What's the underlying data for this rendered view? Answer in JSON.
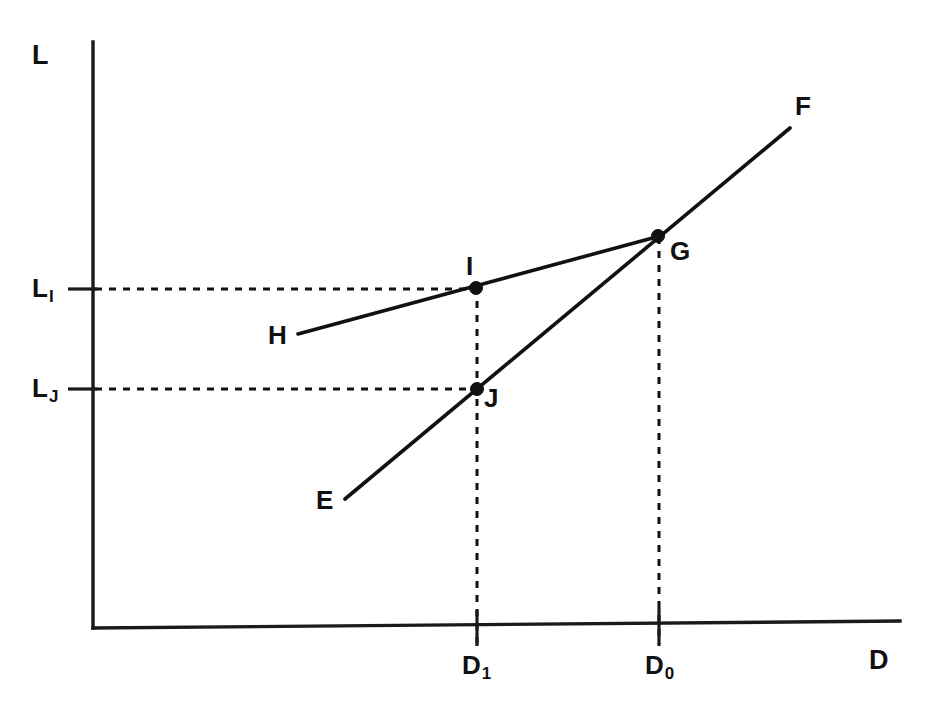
{
  "figure": {
    "type": "line-diagram",
    "background_color": "#ffffff",
    "ink_color": "#111111"
  },
  "axes": {
    "y_axis_label": "L",
    "x_axis_label": "D",
    "origin_px": [
      93,
      628
    ],
    "y_axis_top_px": [
      93,
      42
    ],
    "x_axis_right_px": [
      900,
      621
    ]
  },
  "y_ticks": [
    {
      "name": "L-sub-I",
      "base": "L",
      "sub": "I",
      "label_text": "L",
      "sub_text": "I",
      "y_px": 289
    },
    {
      "name": "L-sub-J",
      "base": "L",
      "sub": "J",
      "label_text": "L",
      "sub_text": "J",
      "y_px": 389
    }
  ],
  "x_ticks": [
    {
      "name": "D-sub-1",
      "base": "D",
      "sub": "1",
      "label_text": "D",
      "sub_text": "1",
      "x_px": 477
    },
    {
      "name": "D-sub-0",
      "base": "D",
      "sub": "0",
      "label_text": "D",
      "sub_text": "0",
      "x_px": 659
    }
  ],
  "lines": [
    {
      "name": "line-EF",
      "start_label": "E",
      "end_label": "F",
      "description": "steeper upward sloping line through J and G",
      "from_px": [
        345,
        499
      ],
      "to_px": [
        790,
        128
      ]
    },
    {
      "name": "line-HG",
      "start_label": "H",
      "end_label": "G",
      "description": "flatter upward sloping line through I ending at G",
      "from_px": [
        298,
        334
      ],
      "to_px": [
        660,
        236
      ]
    }
  ],
  "points": [
    {
      "name": "point-I",
      "label": "I",
      "x_px": 476,
      "y_px": 288,
      "label_pos_px": [
        466,
        253
      ]
    },
    {
      "name": "point-J",
      "label": "J",
      "x_px": 477,
      "y_px": 389,
      "label_pos_px": [
        484,
        385
      ]
    },
    {
      "name": "point-G",
      "label": "G",
      "x_px": 658,
      "y_px": 236,
      "label_pos_px": [
        670,
        238
      ]
    }
  ],
  "endpoint_labels": [
    {
      "name": "label-F",
      "text": "F",
      "pos_px": [
        795,
        93
      ]
    },
    {
      "name": "label-H",
      "text": "H",
      "pos_px": [
        268,
        322
      ]
    },
    {
      "name": "label-E",
      "text": "E",
      "pos_px": [
        316,
        487
      ]
    }
  ],
  "axis_labels": {
    "y": {
      "text": "L",
      "pos_px": [
        32,
        42
      ]
    },
    "x": {
      "text": "D",
      "pos_px": [
        869,
        647
      ]
    }
  },
  "tick_labels": {
    "L_I_pos_px": [
      32,
      275
    ],
    "L_J_pos_px": [
      32,
      375
    ],
    "D_1_pos_px": [
      462,
      652
    ],
    "D_0_pos_px": [
      645,
      652
    ]
  }
}
